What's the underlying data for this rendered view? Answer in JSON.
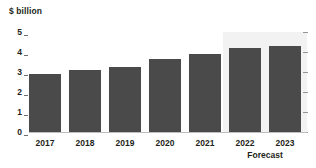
{
  "chart_data": {
    "type": "bar",
    "title": "",
    "subtitle": "",
    "xlabel": "",
    "ylabel": "$ billion",
    "unit_caption": "$ billion",
    "categories": [
      "2017",
      "2018",
      "2019",
      "2020",
      "2021",
      "2022",
      "2023"
    ],
    "values": [
      2.9,
      3.1,
      3.25,
      3.65,
      3.9,
      4.2,
      4.3
    ],
    "series": [
      {
        "name": "Revenue",
        "values": [
          2.9,
          3.1,
          3.25,
          3.65,
          3.9,
          4.2,
          4.3
        ]
      }
    ],
    "ylim": [
      0,
      5
    ],
    "ytick_labels": [
      "5",
      "4",
      "3",
      "2",
      "1",
      "0"
    ],
    "ytick_values": [
      5,
      4,
      3,
      2,
      1,
      0
    ],
    "right_axis_ticks": [
      5,
      4,
      3,
      2,
      1,
      0
    ],
    "grid": false,
    "legend": "none",
    "annotations": [
      {
        "label": "Forecast",
        "covers": [
          "2022",
          "2023"
        ]
      }
    ],
    "forecast_label": "Forecast",
    "forecast_categories": [
      "2022",
      "2023"
    ],
    "colors": {
      "bar": "#4a4a4a",
      "forecast_band": "#f2f2f2",
      "axis": "#bcbec0",
      "tick": "#6d6e71",
      "right_tick": "#939598",
      "text": "#231f20",
      "background": "#ffffff"
    }
  }
}
